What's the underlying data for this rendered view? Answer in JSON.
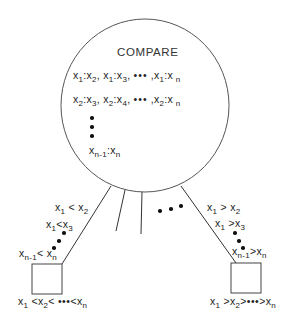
{
  "diagram": {
    "node_label": "COMPARE",
    "comparisons": {
      "row1": [
        "x1:x2",
        "x1:x3",
        "•••",
        "x1:xn"
      ],
      "row2": [
        "x2:x3",
        "x2:x4",
        "•••",
        "x2:xn"
      ],
      "vertical_ellipsis": "⋮",
      "row_last": "xn-1:xn"
    },
    "left_branch": {
      "edge_labels": [
        "x1 < x2",
        "x1 < x3",
        "•••",
        "xn-1 < xn"
      ],
      "leaf_label": "x1 < x2 < ••• < xn"
    },
    "right_branch": {
      "edge_labels": [
        "x1 > x2",
        "x1 > x3",
        "•••",
        "xn-1 > xn"
      ],
      "leaf_label": "x1 > x2 > ••• > xn"
    },
    "middle_branches": {
      "count_drawn": 2,
      "ellipsis": "•••"
    },
    "colors": {
      "stroke": "#333333",
      "background": "#ffffff",
      "text": "#222222"
    }
  }
}
